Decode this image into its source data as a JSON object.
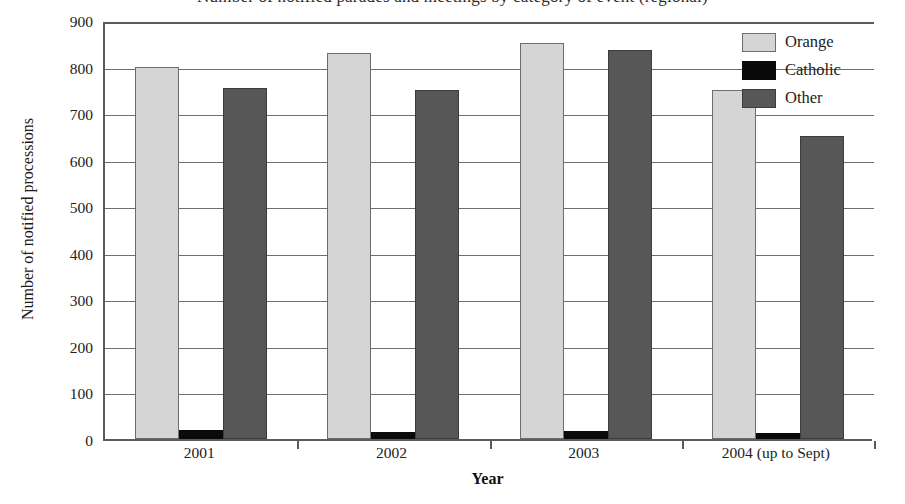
{
  "chart_data": {
    "type": "bar",
    "title": "Number of notified parades and meetings by category of event (regional)",
    "xlabel": "Year",
    "ylabel": "Number of notified processions",
    "categories": [
      "2001",
      "2002",
      "2003",
      "2004 (up to Sept)"
    ],
    "series": [
      {
        "name": "Orange",
        "color": "#d5d5d5",
        "values": [
          800,
          830,
          850,
          750
        ]
      },
      {
        "name": "Catholic",
        "color": "#0a0a0a",
        "values": [
          20,
          14,
          18,
          12
        ]
      },
      {
        "name": "Other",
        "color": "#575757",
        "values": [
          755,
          750,
          835,
          650
        ]
      }
    ],
    "ylim": [
      0,
      900
    ],
    "yticks": [
      0,
      100,
      200,
      300,
      400,
      500,
      600,
      700,
      800,
      900
    ],
    "ytick_labels": [
      "0",
      "100",
      "200",
      "300",
      "400",
      "500",
      "600",
      "700",
      "800",
      "900"
    ],
    "grid": true,
    "legend_position": "top-right",
    "legend_entries": [
      "Orange",
      "Catholic",
      "Other"
    ]
  }
}
